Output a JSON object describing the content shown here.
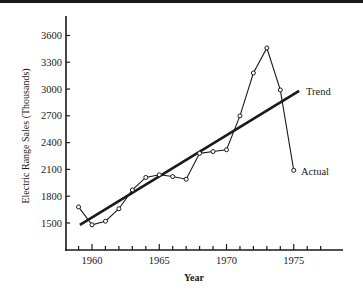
{
  "chart_data": {
    "type": "line",
    "title": "",
    "xlabel": "Year",
    "ylabel": "Electric Range Sales (Thousands)",
    "xlim": [
      1958.5,
      1978
    ],
    "ylim": [
      1200,
      3800
    ],
    "grid": false,
    "x_ticks_major": [
      1960,
      1965,
      1970,
      1975
    ],
    "x_ticks_minor": [
      1959,
      1960,
      1961,
      1962,
      1963,
      1964,
      1965,
      1966,
      1967,
      1968,
      1969,
      1970,
      1971,
      1972,
      1973,
      1974,
      1975,
      1976,
      1977
    ],
    "y_ticks": [
      1500,
      1800,
      2100,
      2400,
      2700,
      3000,
      3300,
      3600
    ],
    "x": [
      1959,
      1960,
      1961,
      1962,
      1963,
      1964,
      1965,
      1966,
      1967,
      1968,
      1969,
      1970,
      1971,
      1972,
      1973,
      1974,
      1975
    ],
    "series": [
      {
        "name": "Actual",
        "style": "line-with-open-circles",
        "values": [
          1680,
          1480,
          1520,
          1660,
          1870,
          2010,
          2040,
          2020,
          1990,
          2280,
          2300,
          2320,
          2700,
          3180,
          3460,
          2990,
          2090
        ]
      },
      {
        "name": "Trend",
        "style": "thick-line",
        "x": [
          1959.1,
          1975.4
        ],
        "values": [
          1480,
          2980
        ]
      }
    ],
    "annotations": [
      {
        "text": "Trend",
        "attached_to": "Trend"
      },
      {
        "text": "Actual",
        "attached_to": "Actual"
      }
    ],
    "legend": "none (inline labels)"
  },
  "labels": {
    "xlabel": "Year",
    "ylabel": "Electric Range Sales (Thousands)",
    "trend": "Trend",
    "actual": "Actual"
  }
}
